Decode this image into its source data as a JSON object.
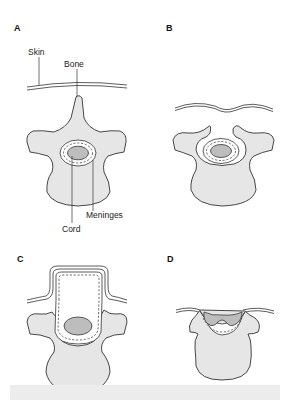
{
  "figure": {
    "panels": [
      {
        "id": "A",
        "label": "A",
        "description": "Normal vertebra with intact skin, bone, meninges and cord"
      },
      {
        "id": "B",
        "label": "B",
        "description": "Spina bifida occulta: unfused vertebral arch, skin dimple"
      },
      {
        "id": "C",
        "label": "C",
        "description": "Meningocele: meninges protrude through bony defect"
      },
      {
        "id": "D",
        "label": "D",
        "description": "Myelomeningocele / open defect: cord exposed"
      }
    ],
    "annotations": {
      "skin": "Skin",
      "bone": "Bone",
      "meninges": "Meninges",
      "cord": "Cord"
    },
    "colors": {
      "bone_fill": "#e6e6e6",
      "cord_fill": "#bdbdbd",
      "outline": "#333333",
      "footer_bar": "#ececec"
    }
  }
}
